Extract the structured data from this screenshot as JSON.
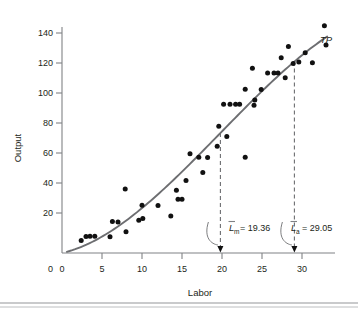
{
  "chart_data": {
    "type": "scatter",
    "title": "",
    "xlabel": "Labor",
    "ylabel": "Output",
    "xlim": [
      0,
      34.5
    ],
    "ylim": [
      0,
      152
    ],
    "grid": false,
    "legend": "none",
    "xticks": [
      0,
      5,
      10,
      15,
      20,
      25,
      30
    ],
    "yticks": [
      0,
      20,
      40,
      60,
      80,
      100,
      120,
      140
    ],
    "series": [
      {
        "name": "observations",
        "type": "scatter",
        "marker": "filled-circle",
        "color": "#111111",
        "points": [
          [
            2.4,
            8.0
          ],
          [
            3.0,
            10.5
          ],
          [
            3.5,
            10.6
          ],
          [
            4.1,
            10.6
          ],
          [
            6.0,
            10.4
          ],
          [
            6.3,
            20.0
          ],
          [
            7.0,
            19.8
          ],
          [
            7.9,
            40.8
          ],
          [
            8.0,
            13.5
          ],
          [
            9.6,
            20.8
          ],
          [
            10.0,
            30.4
          ],
          [
            10.1,
            22.0
          ],
          [
            12.0,
            30.2
          ],
          [
            13.6,
            23.6
          ],
          [
            14.3,
            40.0
          ],
          [
            14.5,
            34.2
          ],
          [
            15.0,
            34.2
          ],
          [
            15.5,
            46.2
          ],
          [
            16.0,
            63.2
          ],
          [
            17.1,
            61.0
          ],
          [
            17.6,
            51.2
          ],
          [
            18.2,
            60.8
          ],
          [
            19.4,
            68.0
          ],
          [
            19.6,
            80.6
          ],
          [
            20.2,
            94.6
          ],
          [
            21.0,
            94.6
          ],
          [
            21.7,
            94.6
          ],
          [
            22.2,
            94.6
          ],
          [
            20.6,
            74.2
          ],
          [
            22.9,
            61.0
          ],
          [
            22.9,
            104.2
          ],
          [
            23.8,
            117.6
          ],
          [
            24.0,
            94.0
          ],
          [
            24.1,
            97.4
          ],
          [
            24.9,
            104.0
          ],
          [
            25.7,
            114.6
          ],
          [
            26.5,
            114.6
          ],
          [
            27.0,
            114.6
          ],
          [
            27.4,
            124.2
          ],
          [
            27.9,
            111.6
          ],
          [
            28.3,
            131.4
          ],
          [
            28.9,
            120.6
          ],
          [
            29.6,
            121.6
          ],
          [
            30.4,
            127.4
          ],
          [
            31.3,
            121.0
          ],
          [
            32.8,
            144.6
          ],
          [
            33.0,
            132.4
          ]
        ]
      },
      {
        "name": "TP",
        "type": "line",
        "color": "#6d6e71",
        "label": "TP",
        "description": "fitted total product curve (cubic S-shape)"
      }
    ],
    "annotations": [
      {
        "id": "Lm",
        "variable": "L",
        "subscript": "m",
        "accent": "bar",
        "equals": "=",
        "value": "19.36",
        "text": "L̄m = 19.36",
        "x": 19.8,
        "marker": "dashed-vertical-with-arrow"
      },
      {
        "id": "La",
        "variable": "L",
        "subscript": "a",
        "accent": "bar",
        "equals": "=",
        "value": "29.05",
        "text": "L̄a = 29.05",
        "x": 29.05,
        "marker": "dashed-vertical-with-arrow"
      }
    ]
  },
  "labels": {
    "y_axis_title": "Output",
    "x_axis_title": "Labor",
    "curve_label": "TP",
    "y_ticks": [
      "0",
      "20",
      "40",
      "60",
      "80",
      "100",
      "120",
      "140"
    ],
    "x_ticks": [
      "0",
      "5",
      "10",
      "15",
      "20",
      "25",
      "30"
    ],
    "annotation_left": {
      "var": "L",
      "sub": "m",
      "eq": "= 19.36"
    },
    "annotation_right": {
      "var": "L",
      "sub": "a",
      "eq": "= 29.05"
    }
  },
  "colors": {
    "dot": "#111111",
    "curve": "#6d6e71",
    "axis": "#808285",
    "text": "#231f20",
    "rule": "#bcbec0"
  }
}
